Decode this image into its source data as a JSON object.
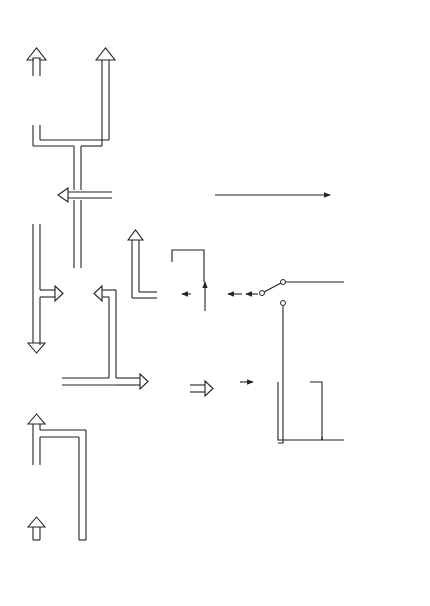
{
  "diagram": {
    "orientation": "rotated-90-ccw",
    "blocks": {
      "da_converter": [
        "D–A",
        "converter"
      ],
      "interpolate": [
        "Interpolate",
        "-conceal"
      ],
      "deinterleave": [
        "Deinterleave",
        "and",
        "error",
        "correction"
      ],
      "capstan_control": [
        "Capstan",
        "control"
      ],
      "output_select": [
        "Output",
        "select"
      ],
      "timebase": [
        "Timebase",
        "corrector"
      ],
      "data_separator": [
        "Data",
        "separator"
      ],
      "preamp": [
        "Pre-",
        "amplifier"
      ],
      "crossfader": [
        "Crossfader"
      ],
      "interleave": [
        "Interleave",
        "and add",
        "redundancy"
      ],
      "channel_coder": [
        "Channel",
        "coder"
      ],
      "write_amp": [
        "Write",
        "amplifier"
      ],
      "ad_converter": [
        "A–D",
        "converter"
      ]
    },
    "labels": {
      "analog_output": [
        "Analog",
        "output"
      ],
      "digital_output": [
        "Digital",
        "output"
      ],
      "tape_travel": [
        "Tape",
        "travel"
      ],
      "capstan": "Capstan",
      "monitor": "Monitor",
      "punch": "Punch/rehearse",
      "read_after_write": [
        "Read after",
        "write",
        "(confidence",
        "replay)"
      ],
      "synchronous": "Synchronous",
      "record": "record",
      "monitor_head": [
        "Monitor",
        "read/play",
        "head"
      ],
      "record_head": [
        "Record/write",
        "head"
      ],
      "advanced_head": [
        "Advanced",
        "read/play",
        "head"
      ],
      "decode_delay": "Decode/encode delay",
      "analog_input": [
        "Analog",
        "input"
      ],
      "digital_input": [
        "Digital",
        "input"
      ]
    }
  }
}
